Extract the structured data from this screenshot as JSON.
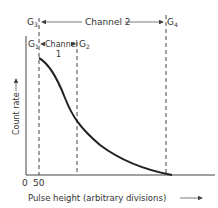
{
  "diagram": {
    "gates": {
      "g1": {
        "label": "G",
        "sub": "1"
      },
      "g2": {
        "label": "G",
        "sub": "2"
      },
      "g3": {
        "label": "G",
        "sub": "3"
      },
      "g4": {
        "label": "G",
        "sub": "4"
      }
    },
    "channel1": {
      "line1": "Channel",
      "line2": "1"
    },
    "channel2": {
      "label": "Channel 2"
    },
    "y_axis_label": "Count rate",
    "x_axis_label": "Pulse height (arbitrary divisions)",
    "x_ticks": [
      "0",
      "50"
    ],
    "colors": {
      "line": "#444444",
      "curve": "#222222",
      "text": "#333333"
    }
  }
}
